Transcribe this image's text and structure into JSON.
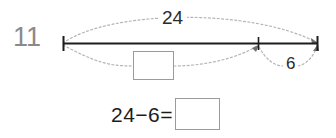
{
  "problem": {
    "number": "11",
    "number_color": "#8a8a8a"
  },
  "numberline": {
    "total_label": "24",
    "part_label": "6",
    "line_color": "#1c1c1c",
    "arc_color": "#b0b0b0",
    "missing_part_placeholder": "",
    "ticks": [
      "left-endpoint",
      "interior-tick",
      "right-endpoint"
    ]
  },
  "equation": {
    "expression": "24−6=",
    "answer_value": "",
    "box_border_color": "#9b9b9b"
  }
}
